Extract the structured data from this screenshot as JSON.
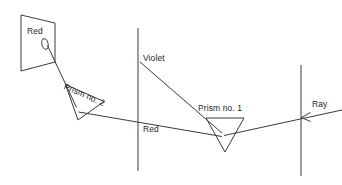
{
  "figure": {
    "background_color": "#ffffff",
    "line_color": "#3a3a3a",
    "text_color": "#262626",
    "width": 342,
    "height": 185
  },
  "labels": {
    "red_screen": "Red",
    "prism_two": "Prism no. 2",
    "violet": "Violet",
    "red_beam": "Red",
    "prism_one": "Prism no. 1",
    "ray": "Ray"
  },
  "geometry": {
    "screen_board": {
      "points": "21,15 55,23 55,62 21,71",
      "aperture": {
        "cx": 45,
        "cy": 44,
        "rx": 3.2,
        "ry": 5.2,
        "rotate": -12
      }
    },
    "prism_two": {
      "points": "66,85 104,102 78,120"
    },
    "prism_one": {
      "points": "206,118 244,118 225,152"
    },
    "screen_line_middle": {
      "x1": 138,
      "y1": 28,
      "x2": 138,
      "y2": 171
    },
    "screen_line_right": {
      "x1": 301,
      "y1": 65,
      "x2": 301,
      "y2": 176
    },
    "ray_incoming": {
      "x1": 342,
      "y1": 110,
      "x2": 226,
      "y2": 135
    },
    "ray_red_out": {
      "x1": 222,
      "y1": 136,
      "x2": 86,
      "y2": 110
    },
    "ray_red_to_prism2": {
      "x1": 86,
      "y1": 110,
      "x2": 76,
      "y2": 108
    },
    "ray_violet": {
      "x1": 222,
      "y1": 133,
      "x2": 140,
      "y2": 62
    },
    "ray_to_screen": {
      "x1": 72,
      "y1": 94,
      "x2": 48,
      "y2": 44
    },
    "arrowhead": {
      "tip_x": 302,
      "tip_y": 117,
      "size": 9
    }
  }
}
